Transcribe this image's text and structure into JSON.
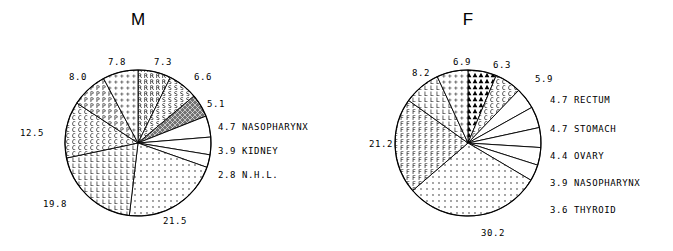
{
  "figure": {
    "background": "#ffffff",
    "ink": "#000000"
  },
  "panels": [
    {
      "id": "m",
      "title": "M",
      "center": {
        "x": 138,
        "y": 143
      },
      "radius": 73
    },
    {
      "id": "f",
      "title": "F",
      "center": {
        "x": 128,
        "y": 143
      },
      "radius": 73
    }
  ],
  "chart_data": [
    {
      "type": "pie",
      "title": "M",
      "xlabel": "",
      "ylabel": "",
      "legend": "labels placed around and to the right of the pie",
      "start_angle_deg": 90,
      "direction": "clockwise",
      "total": 100.0,
      "categories": [
        "7.3",
        "6.6",
        "5.1",
        "NASOPHARYNX",
        "KIDNEY",
        "N.H.L.",
        "21.5",
        "19.8",
        "12.5",
        "8.0",
        "7.8"
      ],
      "values": [
        7.3,
        6.6,
        5.1,
        4.7,
        3.9,
        2.8,
        21.5,
        19.8,
        12.5,
        8.0,
        7.8
      ],
      "slices": [
        {
          "value": 7.3,
          "label": "7.3",
          "name": "",
          "fill": "hatch-r",
          "label_pos": "top"
        },
        {
          "value": 6.6,
          "label": "6.6",
          "name": "",
          "fill": "hatch-s",
          "label_pos": "upper-right"
        },
        {
          "value": 5.1,
          "label": "5.1",
          "name": "",
          "fill": "hatch-dense",
          "label_pos": "right-upper"
        },
        {
          "value": 4.7,
          "label": "4.7",
          "name": "NASOPHARYNX",
          "fill": "blank",
          "label_pos": "right"
        },
        {
          "value": 3.9,
          "label": "3.9",
          "name": "KIDNEY",
          "fill": "blank",
          "label_pos": "right"
        },
        {
          "value": 2.8,
          "label": "2.8",
          "name": "N.H.L.",
          "fill": "blank",
          "label_pos": "right"
        },
        {
          "value": 21.5,
          "label": "21.5",
          "name": "",
          "fill": "dots",
          "label_pos": "bottom-right"
        },
        {
          "value": 19.8,
          "label": "19.8",
          "name": "",
          "fill": "hatch-l",
          "label_pos": "bottom-left"
        },
        {
          "value": 12.5,
          "label": "12.5",
          "name": "",
          "fill": "hatch-c",
          "label_pos": "left"
        },
        {
          "value": 8.0,
          "label": "8.0",
          "name": "",
          "fill": "hatch-p",
          "label_pos": "upper-left"
        },
        {
          "value": 7.8,
          "label": "7.8",
          "name": "",
          "fill": "hatch-plus",
          "label_pos": "top"
        }
      ],
      "outside_labels": [
        {
          "text": "7.8",
          "x": 117,
          "y": 57
        },
        {
          "text": "7.3",
          "x": 163,
          "y": 57
        },
        {
          "text": "8.0",
          "x": 78,
          "y": 72
        },
        {
          "text": "6.6",
          "x": 203,
          "y": 72
        },
        {
          "text": "5.1",
          "x": 216,
          "y": 99
        },
        {
          "text": "12.5",
          "x": 32,
          "y": 128
        },
        {
          "text": "19.8",
          "x": 55,
          "y": 199
        },
        {
          "text": "21.5",
          "x": 175,
          "y": 216
        }
      ],
      "right_labels": [
        {
          "value": "4.7",
          "name": "NASOPHARYNX",
          "x": 218,
          "y": 122
        },
        {
          "value": "3.9",
          "name": "KIDNEY",
          "x": 218,
          "y": 146
        },
        {
          "value": "2.8",
          "name": "N.H.L.",
          "x": 218,
          "y": 170
        }
      ]
    },
    {
      "type": "pie",
      "title": "F",
      "xlabel": "",
      "ylabel": "",
      "legend": "labels placed around and to the right of the pie",
      "start_angle_deg": 90,
      "direction": "clockwise",
      "total": 100.0,
      "categories": [
        "6.3",
        "5.9",
        "RECTUM",
        "STOMACH",
        "OVARY",
        "NASOPHARYNX",
        "THYROID",
        "30.2",
        "21.2",
        "8.2",
        "6.9"
      ],
      "values": [
        6.3,
        5.9,
        4.7,
        4.7,
        4.4,
        3.9,
        3.6,
        30.2,
        21.2,
        8.2,
        6.9
      ],
      "slices": [
        {
          "value": 6.3,
          "label": "6.3",
          "name": "",
          "fill": "hatch-tri",
          "label_pos": "top"
        },
        {
          "value": 5.9,
          "label": "5.9",
          "name": "",
          "fill": "hatch-c",
          "label_pos": "upper-right"
        },
        {
          "value": 4.7,
          "label": "4.7",
          "name": "RECTUM",
          "fill": "blank",
          "label_pos": "right"
        },
        {
          "value": 4.7,
          "label": "4.7",
          "name": "STOMACH",
          "fill": "blank",
          "label_pos": "right"
        },
        {
          "value": 4.4,
          "label": "4.4",
          "name": "OVARY",
          "fill": "blank",
          "label_pos": "right"
        },
        {
          "value": 3.9,
          "label": "3.9",
          "name": "NASOPHARYNX",
          "fill": "blank",
          "label_pos": "right"
        },
        {
          "value": 3.6,
          "label": "3.6",
          "name": "THYROID",
          "fill": "blank",
          "label_pos": "right"
        },
        {
          "value": 30.2,
          "label": "30.2",
          "name": "",
          "fill": "dots",
          "label_pos": "bottom"
        },
        {
          "value": 21.2,
          "label": "21.2",
          "name": "",
          "fill": "hatch-f",
          "label_pos": "left"
        },
        {
          "value": 8.2,
          "label": "8.2",
          "name": "",
          "fill": "hatch-l",
          "label_pos": "upper-left"
        },
        {
          "value": 6.9,
          "label": "6.9",
          "name": "",
          "fill": "hatch-plus",
          "label_pos": "top"
        }
      ],
      "outside_labels": [
        {
          "text": "6.9",
          "x": 122,
          "y": 57
        },
        {
          "text": "6.3",
          "x": 162,
          "y": 60
        },
        {
          "text": "8.2",
          "x": 81,
          "y": 68
        },
        {
          "text": "5.9",
          "x": 204,
          "y": 74
        },
        {
          "text": "21.2",
          "x": 41,
          "y": 139
        },
        {
          "text": "30.2",
          "x": 153,
          "y": 228
        }
      ],
      "right_labels": [
        {
          "value": "4.7",
          "name": "RECTUM",
          "x": 210,
          "y": 95
        },
        {
          "value": "4.7",
          "name": "STOMACH",
          "x": 210,
          "y": 124
        },
        {
          "value": "4.4",
          "name": "OVARY",
          "x": 210,
          "y": 151
        },
        {
          "value": "3.9",
          "name": "NASOPHARYNX",
          "x": 210,
          "y": 178
        },
        {
          "value": "3.6",
          "name": "THYROID",
          "x": 210,
          "y": 205
        }
      ]
    }
  ]
}
